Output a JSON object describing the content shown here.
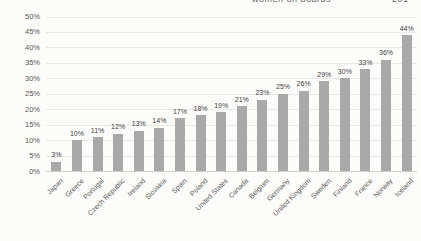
{
  "page_header": {
    "title": "women on boards",
    "page_number": "201"
  },
  "chart_data": {
    "type": "bar",
    "title": "",
    "xlabel": "",
    "ylabel": "",
    "categories": [
      "Japan",
      "Greece",
      "Portugal",
      "Czech Republic",
      "Ireland",
      "Slovakia",
      "Spain",
      "Poland",
      "United States",
      "Canada",
      "Belgium",
      "Germany",
      "United Kingdom",
      "Sweden",
      "Finland",
      "France",
      "Norway",
      "Iceland"
    ],
    "values": [
      3,
      10,
      11,
      12,
      13,
      14,
      17,
      18,
      19,
      21,
      23,
      25,
      26,
      29,
      30,
      33,
      36,
      44
    ],
    "data_labels": [
      "3%",
      "10%",
      "11%",
      "12%",
      "13%",
      "14%",
      "17%",
      "18%",
      "19%",
      "21%",
      "23%",
      "25%",
      "26%",
      "29%",
      "30%",
      "33%",
      "36%",
      "44%"
    ],
    "ylim": [
      0,
      50
    ],
    "ytick_step": 5,
    "yticks": [
      "0%",
      "5%",
      "10%",
      "15%",
      "20%",
      "25%",
      "30%",
      "35%",
      "40%",
      "45%",
      "50%"
    ],
    "grid": true,
    "legend_position": "none",
    "bar_color": "#a9a9a9",
    "gridline_color": "#e9e9e6",
    "axis_text_color": "#595959",
    "data_label_color": "#3f3f3f",
    "x_label_rotation_deg": 45
  }
}
